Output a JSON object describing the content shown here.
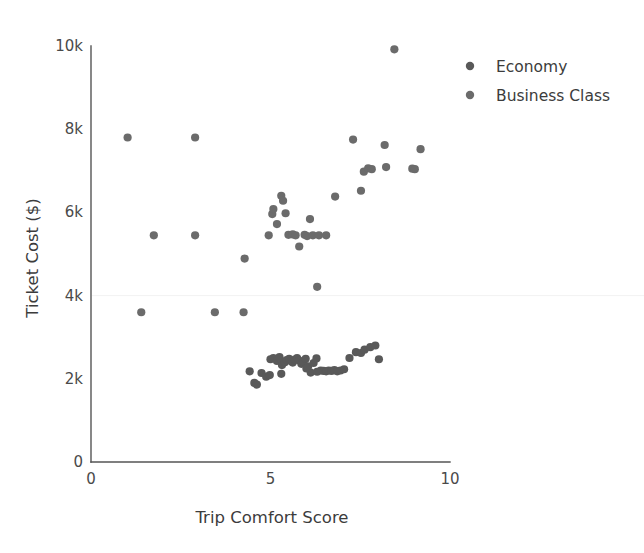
{
  "chart_data": {
    "type": "scatter",
    "title": "",
    "xlabel": "Trip Comfort Score",
    "ylabel": "Ticket Cost ($)",
    "xlim": [
      0,
      10.6
    ],
    "ylim": [
      0,
      10000
    ],
    "xticks": [
      0,
      5,
      10
    ],
    "xticklabels": [
      "0",
      "5",
      "10"
    ],
    "yticks": [
      0,
      2000,
      4000,
      6000,
      8000,
      10000
    ],
    "yticklabels": [
      "0",
      "2k",
      "4k",
      "6k",
      "8k",
      "10k"
    ],
    "grid": "faint-horizontal-at-4k",
    "legend_position": "upper-right-outside",
    "marker_size": 7,
    "series": [
      {
        "name": "Economy",
        "color": "#595959",
        "points": [
          [
            4.42,
            2180
          ],
          [
            4.55,
            1900
          ],
          [
            4.62,
            1860
          ],
          [
            4.75,
            2140
          ],
          [
            4.88,
            2050
          ],
          [
            5.0,
            2470
          ],
          [
            5.08,
            2500
          ],
          [
            5.18,
            2430
          ],
          [
            5.25,
            2520
          ],
          [
            5.32,
            2330
          ],
          [
            5.4,
            2400
          ],
          [
            5.45,
            2450
          ],
          [
            5.52,
            2480
          ],
          [
            5.58,
            2420
          ],
          [
            5.62,
            2390
          ],
          [
            5.68,
            2460
          ],
          [
            5.74,
            2500
          ],
          [
            5.8,
            2440
          ],
          [
            5.86,
            2360
          ],
          [
            5.92,
            2410
          ],
          [
            5.98,
            2480
          ],
          [
            6.05,
            2300
          ],
          [
            6.12,
            2150
          ],
          [
            6.2,
            2380
          ],
          [
            6.28,
            2490
          ],
          [
            6.4,
            2200
          ],
          [
            6.48,
            2190
          ],
          [
            6.55,
            2180
          ],
          [
            6.62,
            2200
          ],
          [
            6.7,
            2190
          ],
          [
            6.78,
            2210
          ],
          [
            6.86,
            2180
          ],
          [
            6.95,
            2200
          ],
          [
            7.05,
            2230
          ],
          [
            7.2,
            2500
          ],
          [
            7.38,
            2640
          ],
          [
            7.52,
            2620
          ],
          [
            7.62,
            2700
          ],
          [
            7.78,
            2760
          ],
          [
            7.92,
            2800
          ],
          [
            8.02,
            2470
          ],
          [
            6.3,
            2170
          ],
          [
            6.0,
            2250
          ],
          [
            5.3,
            2120
          ],
          [
            4.98,
            2090
          ]
        ]
      },
      {
        "name": "Business Class",
        "color": "#6b6b6b",
        "points": [
          [
            1.02,
            7800
          ],
          [
            2.9,
            7800
          ],
          [
            1.4,
            3600
          ],
          [
            1.75,
            5450
          ],
          [
            2.9,
            5450
          ],
          [
            3.45,
            3600
          ],
          [
            4.25,
            3600
          ],
          [
            4.28,
            4890
          ],
          [
            4.95,
            5450
          ],
          [
            5.05,
            5960
          ],
          [
            5.08,
            6080
          ],
          [
            5.18,
            5720
          ],
          [
            5.3,
            6400
          ],
          [
            5.35,
            6280
          ],
          [
            5.42,
            5980
          ],
          [
            5.5,
            5460
          ],
          [
            5.62,
            5470
          ],
          [
            5.7,
            5450
          ],
          [
            5.8,
            5180
          ],
          [
            5.95,
            5460
          ],
          [
            6.02,
            5430
          ],
          [
            6.1,
            5840
          ],
          [
            6.18,
            5450
          ],
          [
            6.35,
            5450
          ],
          [
            6.55,
            5450
          ],
          [
            6.3,
            4210
          ],
          [
            6.8,
            6380
          ],
          [
            7.3,
            7750
          ],
          [
            7.52,
            6520
          ],
          [
            7.6,
            6980
          ],
          [
            7.72,
            7060
          ],
          [
            7.82,
            7040
          ],
          [
            8.18,
            7620
          ],
          [
            8.22,
            7090
          ],
          [
            8.45,
            9920
          ],
          [
            8.95,
            7050
          ],
          [
            9.02,
            7040
          ],
          [
            9.18,
            7520
          ]
        ]
      }
    ]
  },
  "legend": {
    "items": [
      {
        "label": "Economy",
        "color": "#595959"
      },
      {
        "label": "Business Class",
        "color": "#6b6b6b"
      }
    ]
  },
  "axes": {
    "x_title": "Trip Comfort Score",
    "y_title": "Ticket Cost ($)",
    "x_tick_labels": [
      "0",
      "5",
      "10"
    ],
    "y_tick_labels": [
      "0",
      "2k",
      "4k",
      "6k",
      "8k",
      "10k"
    ]
  }
}
